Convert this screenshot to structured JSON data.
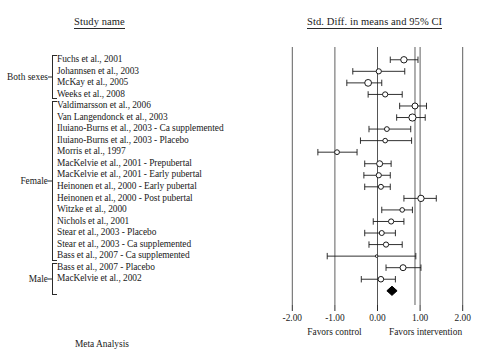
{
  "headers": {
    "study_name": "Study name",
    "plot": "Std. Diff. in means and 95% CI"
  },
  "footer": {
    "meta_analysis": "Meta Analysis"
  },
  "axis": {
    "labels": [
      "-2.00",
      "-1.00",
      "0.00",
      "1.00",
      "2.00"
    ],
    "values": [
      -2,
      -1,
      0,
      1,
      2
    ],
    "favors_left": "Favors control",
    "favors_right": "Favors intervention"
  },
  "groups": [
    {
      "label": "Both sexes",
      "start": 0,
      "end": 3
    },
    {
      "label": "Female",
      "start": 4,
      "end": 17
    },
    {
      "label": "Male",
      "start": 18,
      "end": 20
    }
  ],
  "chart_data": {
    "type": "forest",
    "title": "Std. Diff. in means and 95% CI",
    "xlabel": "Std. Diff. in means",
    "ylabel": "Study name",
    "xlim": [
      -2.4,
      2.4
    ],
    "xticks": [
      -2,
      -1,
      0,
      1,
      2
    ],
    "grid": true,
    "legend": "none",
    "null_line": 0,
    "favors_left": "Favors control",
    "favors_right": "Favors intervention",
    "studies": [
      {
        "name": "Fuchs et al., 2001",
        "effect": 0.62,
        "lower": 0.3,
        "upper": 0.95,
        "size": 3.2
      },
      {
        "name": "Johannsen et al., 2003",
        "effect": 0.03,
        "lower": -0.58,
        "upper": 0.64,
        "size": 2.6
      },
      {
        "name": "McKay et al., 2005",
        "effect": -0.22,
        "lower": -0.72,
        "upper": 0.1,
        "size": 3.4
      },
      {
        "name": "Weeks et al., 2008",
        "effect": 0.18,
        "lower": -0.22,
        "upper": 0.58,
        "size": 2.6
      },
      {
        "name": "Valdimarsson et al., 2006",
        "effect": 0.88,
        "lower": 0.52,
        "upper": 1.15,
        "size": 3.0
      },
      {
        "name": "Van Langendonck et al., 2003",
        "effect": 0.82,
        "lower": 0.45,
        "upper": 1.12,
        "size": 3.6
      },
      {
        "name": "Iluiano-Burns et al., 2003 - Ca supplemented",
        "effect": 0.22,
        "lower": -0.2,
        "upper": 0.78,
        "size": 2.4
      },
      {
        "name": "Iluiano-Burns et al., 2003 - Placebo",
        "effect": 0.18,
        "lower": -0.4,
        "upper": 0.8,
        "size": 2.3
      },
      {
        "name": "Morris et al., 1997",
        "effect": -0.95,
        "lower": -1.4,
        "upper": -0.48,
        "size": 2.4
      },
      {
        "name": "MacKelvie et al., 2001 - Prepubertal",
        "effect": 0.05,
        "lower": -0.3,
        "upper": 0.32,
        "size": 3.0
      },
      {
        "name": "MacKelvie et al., 2001 - Early pubertal",
        "effect": 0.03,
        "lower": -0.32,
        "upper": 0.3,
        "size": 2.6
      },
      {
        "name": "Heinonen et al., 2000 - Early pubertal",
        "effect": 0.08,
        "lower": -0.3,
        "upper": 0.3,
        "size": 2.5
      },
      {
        "name": "Heinonen et al., 2000 - Post pubertal",
        "effect": 1.02,
        "lower": 0.62,
        "upper": 1.38,
        "size": 3.2
      },
      {
        "name": "Witzke et al., 2000",
        "effect": 0.58,
        "lower": 0.1,
        "upper": 0.82,
        "size": 2.3
      },
      {
        "name": "Nichols et al., 2001",
        "effect": 0.32,
        "lower": -0.1,
        "upper": 0.62,
        "size": 2.6
      },
      {
        "name": "Stear et al., 2003 - Placebo",
        "effect": 0.1,
        "lower": -0.3,
        "upper": 0.42,
        "size": 2.5
      },
      {
        "name": "Stear et al., 2003 - Ca supplemented",
        "effect": 0.2,
        "lower": -0.2,
        "upper": 0.58,
        "size": 2.6
      },
      {
        "name": "Bass et al., 2007 - Ca supplemented",
        "effect": -0.02,
        "lower": -1.18,
        "upper": 0.9,
        "size": 1.3
      },
      {
        "name": "Bass et al., 2007 - Placebo",
        "effect": 0.6,
        "lower": 0.2,
        "upper": 1.02,
        "size": 3.0
      },
      {
        "name": "MacKelvie et al., 2002",
        "effect": 0.08,
        "lower": -0.38,
        "upper": 0.42,
        "size": 2.8
      },
      {
        "name": "Summary",
        "effect": 0.34,
        "lower": 0.22,
        "upper": 0.46,
        "size": 0,
        "is_summary": true
      }
    ],
    "summary": {
      "effect": 0.34,
      "lower": 0.22,
      "upper": 0.46
    }
  }
}
